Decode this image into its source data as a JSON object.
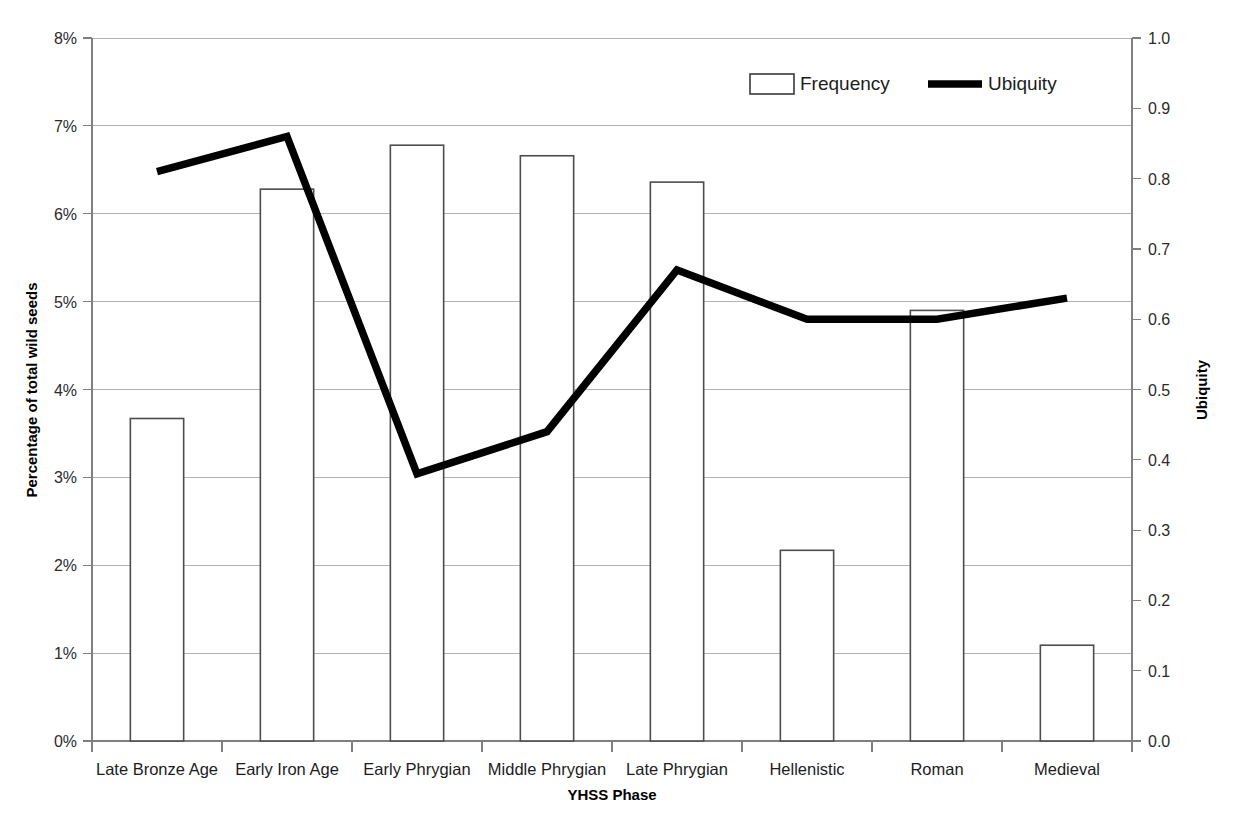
{
  "chart_data": {
    "type": "bar",
    "title": "",
    "xlabel": "YHSS Phase",
    "ylabel": "Percentage of total wild seeds",
    "y2label": "Ubiquity",
    "grid": true,
    "legend_position": "top-right",
    "categories": [
      "Late Bronze Age",
      "Early Iron Age",
      "Early Phrygian",
      "Middle Phrygian",
      "Late Phrygian",
      "Hellenistic",
      "Roman",
      "Medieval"
    ],
    "ylim": [
      0,
      8
    ],
    "ytick_labels": [
      "0%",
      "1%",
      "2%",
      "3%",
      "4%",
      "5%",
      "6%",
      "7%",
      "8%"
    ],
    "ytick_values": [
      0,
      1,
      2,
      3,
      4,
      5,
      6,
      7,
      8
    ],
    "y2lim": [
      0.0,
      1.0
    ],
    "y2tick_labels": [
      "0.0",
      "0.1",
      "0.2",
      "0.3",
      "0.4",
      "0.5",
      "0.6",
      "0.7",
      "0.8",
      "0.9",
      "1.0"
    ],
    "y2tick_values": [
      0.0,
      0.1,
      0.2,
      0.3,
      0.4,
      0.5,
      0.6,
      0.7,
      0.8,
      0.9,
      1.0
    ],
    "series": [
      {
        "name": "Frequency",
        "type": "bar",
        "axis": "left",
        "unit": "%",
        "values": [
          3.67,
          6.28,
          6.78,
          6.66,
          6.36,
          2.17,
          4.9,
          1.09
        ]
      },
      {
        "name": "Ubiquity",
        "type": "line",
        "axis": "right",
        "values": [
          0.81,
          0.86,
          0.38,
          0.44,
          0.67,
          0.6,
          0.6,
          0.63
        ]
      }
    ]
  },
  "legend": {
    "frequency_label": "Frequency",
    "ubiquity_label": "Ubiquity"
  },
  "axes": {
    "y_left_title": "Percentage of total wild seeds",
    "y_right_title": "Ubiquity",
    "x_title": "YHSS Phase"
  },
  "colors": {
    "bar_fill": "#ffffff",
    "bar_stroke": "#4d4d4d",
    "line_stroke": "#000000",
    "grid": "#b3b3b3",
    "axis": "#7f7f7f",
    "text": "#1c1c1c",
    "background": "#ffffff"
  }
}
